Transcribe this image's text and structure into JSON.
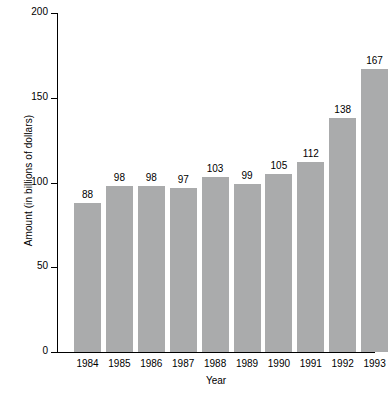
{
  "chart_data": {
    "type": "bar",
    "title": "",
    "xlabel": "Year",
    "ylabel": "Amount (in billions of dollars)",
    "categories": [
      "1984",
      "1985",
      "1986",
      "1987",
      "1988",
      "1989",
      "1990",
      "1991",
      "1992",
      "1993"
    ],
    "values": [
      88,
      98,
      98,
      97,
      103,
      99,
      105,
      112,
      138,
      167
    ],
    "data_labels": [
      "88",
      "98",
      "98",
      "97",
      "103",
      "99",
      "105",
      "112",
      "138",
      "167"
    ],
    "ylim": [
      0,
      200
    ],
    "yticks": [
      0,
      50,
      100,
      150,
      200
    ],
    "ytick_labels": [
      "0",
      "50",
      "100",
      "150",
      "200"
    ],
    "grid": false,
    "legend": false,
    "bar_color": "#aaabac",
    "axis_color": "#000000",
    "background_color": "#ffffff"
  }
}
